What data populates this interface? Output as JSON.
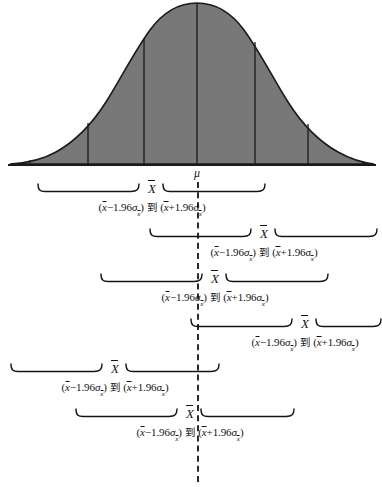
{
  "figure": {
    "type": "statistics-diagram",
    "mu_label": "μ",
    "xbar_label": "X",
    "curve_fill_color": "#787878",
    "curve_stroke_color": "#1a1a1a",
    "dash_color": "#2a2a2a",
    "baseline_color": "#1a1a1a"
  },
  "curve": {
    "peak_x": 197,
    "baseline_y": 165,
    "divider_x_positions": [
      30,
      88,
      144,
      197,
      255,
      308,
      363
    ]
  },
  "formula": {
    "lower_open": "(",
    "xbar": "x",
    "minus": "−1.96",
    "plus": "+1.96",
    "sigma": "σ",
    "sigma_sub": "x",
    "close": ")",
    "to": "到",
    "full_text": "(x̄ −1.96σx̄ ) 到 (x̄ +1.96σx̄ )"
  },
  "intervals": [
    {
      "index": 1,
      "center_x": 152,
      "left_x": 37,
      "right_x": 266,
      "top_y": 183
    },
    {
      "index": 2,
      "center_x": 264,
      "left_x": 149,
      "right_x": 378,
      "top_y": 228
    },
    {
      "index": 3,
      "center_x": 215,
      "left_x": 100,
      "right_x": 329,
      "top_y": 273
    },
    {
      "index": 4,
      "center_x": 305,
      "left_x": 190,
      "right_x": 382,
      "top_y": 318
    },
    {
      "index": 5,
      "center_x": 115,
      "left_x": 10,
      "right_x": 220,
      "top_y": 363
    },
    {
      "index": 6,
      "center_x": 190,
      "left_x": 75,
      "right_x": 295,
      "top_y": 408
    }
  ],
  "chart_data": {
    "type": "area",
    "title": "",
    "xlabel": "",
    "ylabel": "",
    "series": [
      {
        "name": "normal-distribution",
        "mean": 197,
        "note": "bell-shaped sampling distribution of the sample mean"
      }
    ],
    "annotations": [
      {
        "label": "μ",
        "x": 197,
        "y": 172
      }
    ],
    "grid": false,
    "legend": "none"
  }
}
